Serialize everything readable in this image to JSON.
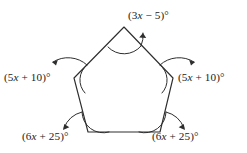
{
  "figure": {
    "type": "geometry-diagram",
    "shape_name": "pentagon",
    "background_color": "#ffffff",
    "stroke_color": "#2e2e2e",
    "text_color": "#1c1c1c",
    "vertices": [
      {
        "name": "apex",
        "x": 124,
        "y": 27
      },
      {
        "name": "right",
        "x": 173,
        "y": 78
      },
      {
        "name": "bottom-right",
        "x": 160,
        "y": 132
      },
      {
        "name": "bottom-left",
        "x": 88,
        "y": 132
      },
      {
        "name": "left",
        "x": 74,
        "y": 78
      }
    ],
    "angle_labels": {
      "top": "(3x − 5)°",
      "left": "(5x + 10)°",
      "right": "(5x + 10)°",
      "bottom_left": "(6x + 25)°",
      "bottom_right": "(6x + 25)°"
    },
    "arrow_directions": {
      "top": "up-right",
      "left": "up-left",
      "right": "up-right",
      "bottom_left": "down-left",
      "bottom_right": "down-right"
    }
  }
}
